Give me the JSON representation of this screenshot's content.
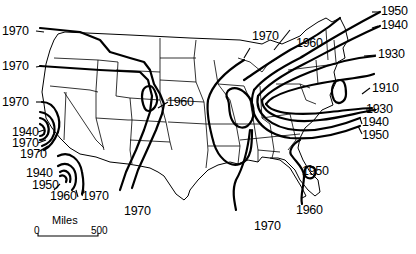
{
  "figure": {
    "type": "isochrone map of contiguous United States",
    "contour_labels": {
      "west_top": "1970",
      "west_mid": "1970",
      "west_ca_top": "1970",
      "ca_1940": "1940",
      "ca_1970a": "1970",
      "ca_1970b": "1970",
      "socal_1940": "1940",
      "socal_1950": "1950",
      "socal_1960": "1960",
      "socal_1970": "1970",
      "rockies_1960": "1960",
      "south_1970_west": "1970",
      "midwest_1970": "1970",
      "gulf_1970": "1970",
      "central_1960": "1960",
      "ne_1950": "1950",
      "ne_1940": "1940",
      "ne_1930_top": "1930",
      "ne_1910": "1910",
      "ne_1930_bottom": "1930",
      "se_1940": "1940",
      "se_1950": "1950",
      "fl_1950": "1950",
      "fl_1960": "1960"
    },
    "scale_bar": {
      "title": "Miles",
      "start": "0",
      "end": "500"
    }
  }
}
